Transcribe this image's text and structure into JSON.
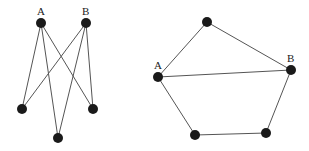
{
  "graphs": [
    {
      "name": "bipartite-graph",
      "nodes": [
        {
          "id": "A",
          "label": "A",
          "x": 41,
          "y": 23
        },
        {
          "id": "B",
          "label": "B",
          "x": 86,
          "y": 23
        },
        {
          "id": "L",
          "label": "",
          "x": 22,
          "y": 109
        },
        {
          "id": "R",
          "label": "",
          "x": 93,
          "y": 109
        },
        {
          "id": "M",
          "label": "",
          "x": 58,
          "y": 138
        }
      ],
      "edges": [
        [
          "A",
          "L"
        ],
        [
          "A",
          "M"
        ],
        [
          "A",
          "R"
        ],
        [
          "B",
          "L"
        ],
        [
          "B",
          "M"
        ],
        [
          "B",
          "R"
        ]
      ]
    },
    {
      "name": "pentagon-graph",
      "nodes": [
        {
          "id": "T",
          "label": "",
          "x": 207,
          "y": 22
        },
        {
          "id": "A",
          "label": "A",
          "x": 158,
          "y": 77
        },
        {
          "id": "B",
          "label": "B",
          "x": 291,
          "y": 70
        },
        {
          "id": "BL",
          "label": "",
          "x": 195,
          "y": 135
        },
        {
          "id": "BR",
          "label": "",
          "x": 266,
          "y": 133
        }
      ],
      "edges": [
        [
          "T",
          "A"
        ],
        [
          "T",
          "B"
        ],
        [
          "A",
          "B"
        ],
        [
          "A",
          "BL"
        ],
        [
          "BL",
          "BR"
        ],
        [
          "BR",
          "B"
        ]
      ]
    }
  ],
  "colors": {
    "node": "#1a1a1a",
    "edge": "#555555",
    "background": "#ffffff"
  }
}
